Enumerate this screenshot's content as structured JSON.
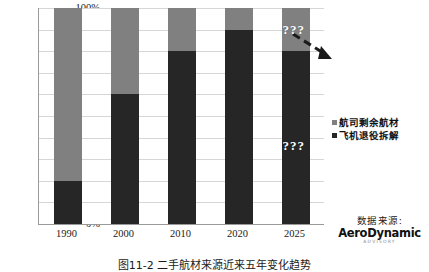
{
  "chart_data": {
    "type": "bar",
    "title": "",
    "subtitle": "",
    "xlabel": "",
    "ylabel": "",
    "ylim": [
      0,
      100
    ],
    "grid": true,
    "stacked": true,
    "stack_total_percent": 100,
    "legend_position": "right",
    "categories": [
      "1990",
      "2000",
      "2010",
      "2020",
      "2025"
    ],
    "ytick_labels": [
      "0%",
      "10%",
      "20%",
      "30%",
      "40%",
      "50%",
      "60%",
      "70%",
      "80%",
      "90%",
      "100%"
    ],
    "ytick_values": [
      0,
      10,
      20,
      30,
      40,
      50,
      60,
      70,
      80,
      90,
      100
    ],
    "series": [
      {
        "name": "飞机退役拆解",
        "color": "#262626",
        "stack_order": "bottom",
        "values": [
          20,
          60,
          80,
          90,
          80
        ]
      },
      {
        "name": "航司剩余航材",
        "color": "#808080",
        "stack_order": "top",
        "values": [
          80,
          40,
          20,
          10,
          20
        ]
      }
    ],
    "annotations": [
      {
        "text": "???",
        "category": "2025",
        "series": "航司剩余航材",
        "color": "#ffffff"
      },
      {
        "text": "???",
        "category": "2025",
        "series": "飞机退役拆解",
        "color": "#ffffff"
      },
      {
        "text": "",
        "type": "dashed-arrow",
        "from": "2020",
        "to": "2025"
      }
    ]
  },
  "legend": {
    "items": [
      {
        "label": "航司剩余航材",
        "color": "#808080"
      },
      {
        "label": "飞机退役拆解",
        "color": "#262626"
      }
    ]
  },
  "source": {
    "label": "数据来源:",
    "logo_main": "AeroDynamic",
    "logo_sub": "ADVISORY"
  },
  "caption": {
    "text": "图11-2  二手航材来源近来五年变化趋势"
  }
}
